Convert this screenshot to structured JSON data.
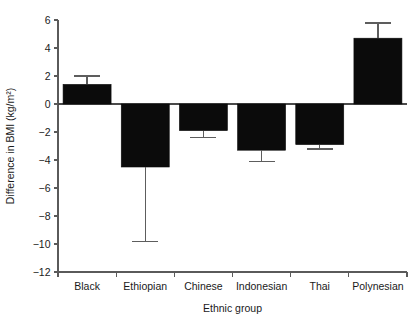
{
  "chart_data": {
    "type": "bar",
    "title": "",
    "xlabel": "Ethnic group",
    "ylabel": "Difference in BMI (kg/m²)",
    "categories": [
      "Black",
      "Ethiopian",
      "Chinese",
      "Indonesian",
      "Thai",
      "Polynesian"
    ],
    "values": [
      1.4,
      -4.5,
      -1.9,
      -3.3,
      -2.9,
      4.7
    ],
    "errors_low": [
      1.4,
      -9.8,
      -2.4,
      -4.1,
      -3.2,
      4.7
    ],
    "errors_high": [
      2.0,
      -4.5,
      -1.9,
      -3.3,
      -2.9,
      5.8
    ],
    "ylim": [
      -12,
      6
    ],
    "yticks": [
      6,
      4,
      2,
      0,
      -2,
      -4,
      -6,
      -8,
      -10,
      -12
    ],
    "ytick_labels": [
      "6",
      "4",
      "2",
      "0",
      "−2",
      "−4",
      "−6",
      "−8",
      "−10",
      "−12"
    ],
    "grid": false,
    "legend": "none",
    "series": [
      {
        "name": "Difference in BMI",
        "values": [
          1.4,
          -4.5,
          -1.9,
          -3.3,
          -2.9,
          4.7
        ]
      }
    ],
    "colors": {
      "bar": "#0b0b0b",
      "axis": "#5a5a5a",
      "error": "#5d5d5d",
      "background": "#ffffff"
    }
  }
}
